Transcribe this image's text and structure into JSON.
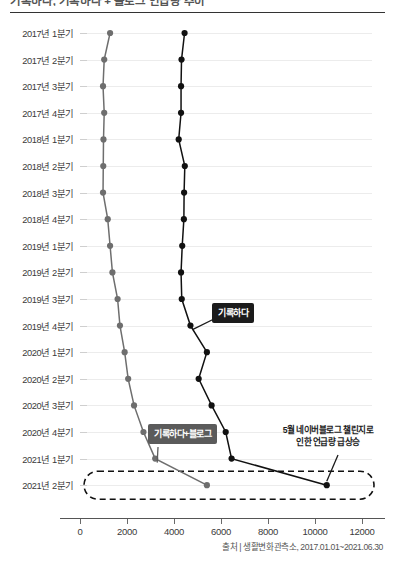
{
  "header": {
    "title": "기록하다, 기록하다 + 블로그 언급량 추이",
    "rule_color": "#333333"
  },
  "source": {
    "text": "출처 | 생활변화관측소, 2017.01.01~2021.06.30"
  },
  "annotations": [
    {
      "name": "annot-record",
      "label": "기록하다",
      "style": "dark"
    },
    {
      "name": "annot-record-blog",
      "label": "기록하다+블로그",
      "style": "gray"
    },
    {
      "name": "annot-spike",
      "label_line1": "5월 네이버블로그 챌린지로",
      "label_line2": "인한 언급량 급상승",
      "style": "red"
    }
  ],
  "chart_data": {
    "type": "line",
    "orientation": "horizontal",
    "title": "기록하다, 기록하다 + 블로그 언급량 추이",
    "xlabel": "",
    "ylabel": "",
    "xlim": [
      0,
      12000
    ],
    "xticks": [
      0,
      2000,
      4000,
      6000,
      8000,
      10000,
      12000
    ],
    "xtick_labels": [
      "0",
      "2000",
      "4000",
      "6000",
      "8000",
      "10000",
      "12000"
    ],
    "grid": true,
    "legend_position": "inline-annotation",
    "categories": [
      "2017년 1분기",
      "2017년 2분기",
      "2017년 3분기",
      "2017년 4분기",
      "2018년 1분기",
      "2018년 2분기",
      "2018년 3분기",
      "2018년 4분기",
      "2019년 1분기",
      "2019년 2분기",
      "2019년 3분기",
      "2019년 4분기",
      "2020년 1분기",
      "2020년 2분기",
      "2020년 3분기",
      "2020년 4분기",
      "2021년 1분기",
      "2021년 2분기"
    ],
    "series": [
      {
        "name": "기록하다+블로그",
        "color": "#6e6e6e",
        "values": [
          1280,
          1030,
          980,
          1030,
          1000,
          990,
          980,
          1180,
          1280,
          1380,
          1600,
          1700,
          1900,
          2050,
          2300,
          2700,
          3200,
          5400
        ]
      },
      {
        "name": "기록하다",
        "color": "#111111",
        "values": [
          4450,
          4320,
          4300,
          4300,
          4200,
          4460,
          4430,
          4420,
          4350,
          4300,
          4330,
          4700,
          5400,
          5050,
          5600,
          6200,
          6450,
          10500
        ]
      }
    ],
    "highlight": {
      "name": "last-quarter-highlight",
      "category": "2021년 2분기",
      "style": "dashed-ellipse"
    }
  }
}
